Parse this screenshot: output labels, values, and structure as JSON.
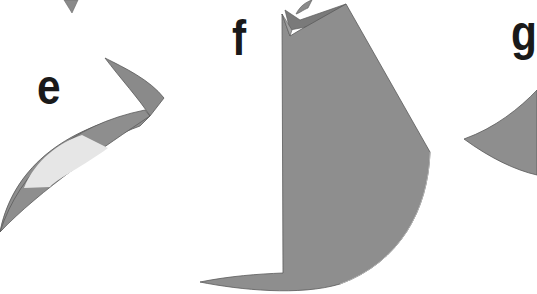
{
  "diagram": {
    "type": "origami-step-sequence",
    "steps": [
      {
        "label": "e"
      },
      {
        "label": "f"
      },
      {
        "label": "g"
      }
    ],
    "colors": {
      "paper_main": "#8e8e8e",
      "paper_dark": "#7a7a7a",
      "paper_light": "#e6e6e6",
      "outline": "#5a5a5a",
      "label": "#1a1a1a",
      "background": "#ffffff"
    }
  }
}
